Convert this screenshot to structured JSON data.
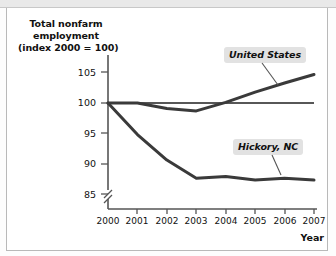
{
  "figure": {
    "y_axis_title_lines": [
      "Total nonfarm",
      "employment",
      "(index 2000 = 100)"
    ],
    "x_axis_name": "Year",
    "callouts": {
      "us": "United States",
      "hickory": "Hickory, NC"
    },
    "colors": {
      "line": "#3a3a3a",
      "axis": "#555555",
      "callout_background": "#e2e2e2",
      "text": "#111111",
      "page_background": "#ffffff",
      "top_strip": "#e9e9e9"
    }
  },
  "chart_data": {
    "type": "line",
    "title": "",
    "xlabel": "Year",
    "ylabel": "Total nonfarm employment (index 2000 = 100)",
    "x": [
      2000,
      2001,
      2002,
      2003,
      2004,
      2005,
      2006,
      2007
    ],
    "xticklabels": [
      "2000",
      "2001",
      "2002",
      "2003",
      "2004",
      "2005",
      "2006",
      "2007"
    ],
    "yticks": [
      85,
      90,
      95,
      100,
      105
    ],
    "yticklabels": [
      "85",
      "90",
      "95",
      "100",
      "105"
    ],
    "ylim": [
      83.5,
      106.5
    ],
    "xlim": [
      2000,
      2007
    ],
    "y_axis_break": true,
    "grid": false,
    "legend": "callout-labels",
    "series": [
      {
        "name": "United States",
        "values": [
          100.0,
          100.0,
          99.1,
          98.7,
          100.1,
          101.8,
          103.3,
          104.7
        ]
      },
      {
        "name": "Hickory, NC",
        "values": [
          100.0,
          94.8,
          90.6,
          87.6,
          87.9,
          87.3,
          87.6,
          87.3
        ]
      },
      {
        "name": "Reference line (index = 100)",
        "values": [
          100.0,
          100.0,
          100.0,
          100.0,
          100.0,
          100.0,
          100.0,
          100.0
        ]
      }
    ]
  }
}
